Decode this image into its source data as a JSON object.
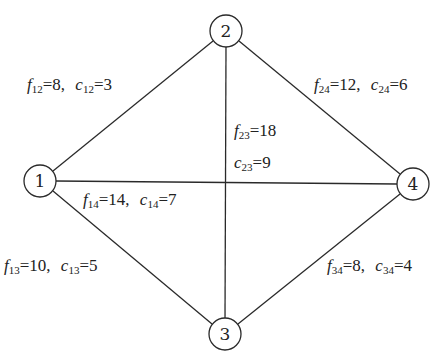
{
  "nodes": [
    {
      "id": "1",
      "label": "1",
      "x": 40,
      "y": 181
    },
    {
      "id": "2",
      "label": "2",
      "x": 226,
      "y": 31
    },
    {
      "id": "3",
      "label": "3",
      "x": 225,
      "y": 334
    },
    {
      "id": "4",
      "label": "4",
      "x": 413,
      "y": 184
    }
  ],
  "edges": [
    {
      "id": "12",
      "from": "1",
      "to": "2",
      "f_sub": "12",
      "f_val": "8",
      "c_sub": "12",
      "c_val": "3"
    },
    {
      "id": "24",
      "from": "2",
      "to": "4",
      "f_sub": "24",
      "f_val": "12",
      "c_sub": "24",
      "c_val": "6"
    },
    {
      "id": "23",
      "from": "2",
      "to": "3",
      "f_sub": "23",
      "f_val": "18",
      "c_sub": "23",
      "c_val": "9"
    },
    {
      "id": "14",
      "from": "1",
      "to": "4",
      "f_sub": "14",
      "f_val": "14",
      "c_sub": "14",
      "c_val": "7"
    },
    {
      "id": "13",
      "from": "1",
      "to": "3",
      "f_sub": "13",
      "f_val": "10",
      "c_sub": "13",
      "c_val": "5"
    },
    {
      "id": "34",
      "from": "3",
      "to": "4",
      "f_sub": "34",
      "f_val": "8",
      "c_sub": "34",
      "c_val": "4"
    }
  ],
  "labels": {
    "e12": {
      "f": "f",
      "fs": "12",
      "fv": "=8,",
      "c": "c",
      "cs": "12",
      "cv": "=3"
    },
    "e24": {
      "f": "f",
      "fs": "24",
      "fv": "=12,",
      "c": "c",
      "cs": "24",
      "cv": "=6"
    },
    "e23f": {
      "f": "f",
      "fs": "23",
      "fv": "=18"
    },
    "e23c": {
      "c": "c",
      "cs": "23",
      "cv": "=9"
    },
    "e14": {
      "f": "f",
      "fs": "14",
      "fv": "=14,",
      "c": "c",
      "cs": "14",
      "cv": "=7"
    },
    "e13": {
      "f": "f",
      "fs": "13",
      "fv": "=10,",
      "c": "c",
      "cs": "13",
      "cv": "=5"
    },
    "e34": {
      "f": "f",
      "fs": "34",
      "fv": "=8,",
      "c": "c",
      "cs": "34",
      "cv": "=4"
    }
  }
}
